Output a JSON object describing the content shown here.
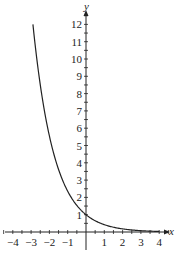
{
  "chart_data": {
    "type": "line",
    "title": "",
    "xlabel": "x",
    "ylabel": "y",
    "xlim": [
      -4.4,
      4.4
    ],
    "ylim": [
      -0.6,
      12.9
    ],
    "grid": false,
    "legend": null,
    "x_ticks": [
      "-4",
      "-3",
      "-2",
      "-1",
      "1",
      "2",
      "3",
      "4"
    ],
    "y_ticks": [
      "1",
      "2",
      "3",
      "4",
      "5",
      "6",
      "7",
      "8",
      "9",
      "10",
      "11",
      "12"
    ],
    "series": [
      {
        "name": "exponential decay curve",
        "x": [
          -2.9,
          -2.5,
          -2.0,
          -1.5,
          -1.0,
          -0.5,
          0,
          0.5,
          1.0,
          1.5,
          2.0,
          2.5,
          3.0,
          3.5,
          4.0
        ],
        "y": [
          12.0,
          8.6,
          5.6,
          3.6,
          2.4,
          1.5,
          1.0,
          0.65,
          0.42,
          0.28,
          0.18,
          0.12,
          0.08,
          0.05,
          0.03
        ]
      }
    ],
    "color": "#222222"
  }
}
